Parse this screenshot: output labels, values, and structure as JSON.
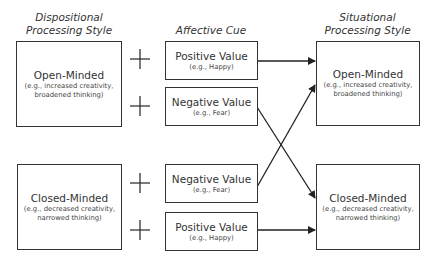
{
  "headers": {
    "dispositional": [
      "Dispositional",
      "Processing Style"
    ],
    "affective": "Affective Cue",
    "situational": [
      "Situational",
      "Processing Style"
    ]
  },
  "dispositional_boxes": [
    {
      "title": "Open-Minded",
      "sub1": "(e.g., increased creativity,",
      "sub2": "broadened thinking)"
    },
    {
      "title": "Closed-Minded",
      "sub1": "(e.g., decreased creativity,",
      "sub2": "narrowed thinking)"
    }
  ],
  "affective_boxes": [
    {
      "title": "Positive Value",
      "sub": "(e.g., Happy)"
    },
    {
      "title": "Negative Value",
      "sub": "(e.g., Fear)"
    },
    {
      "title": "Negative Value",
      "sub": "(e.g., Fear)"
    },
    {
      "title": "Positive Value",
      "sub": "(e.g., Happy)"
    }
  ],
  "situational_boxes": [
    {
      "title": "Open-Minded",
      "sub1": "(e.g., increased creativity,",
      "sub2": "broadened thinking)"
    },
    {
      "title": "Closed-Minded",
      "sub1": "(e.g., decreased creativity,",
      "sub2": "narrowed thinking)"
    }
  ],
  "plus_symbol": "+",
  "connections": [
    {
      "from": "affective_boxes.0",
      "to": "situational_boxes.0"
    },
    {
      "from": "affective_boxes.1",
      "to": "situational_boxes.1"
    },
    {
      "from": "affective_boxes.2",
      "to": "situational_boxes.0"
    },
    {
      "from": "affective_boxes.3",
      "to": "situational_boxes.1"
    }
  ]
}
